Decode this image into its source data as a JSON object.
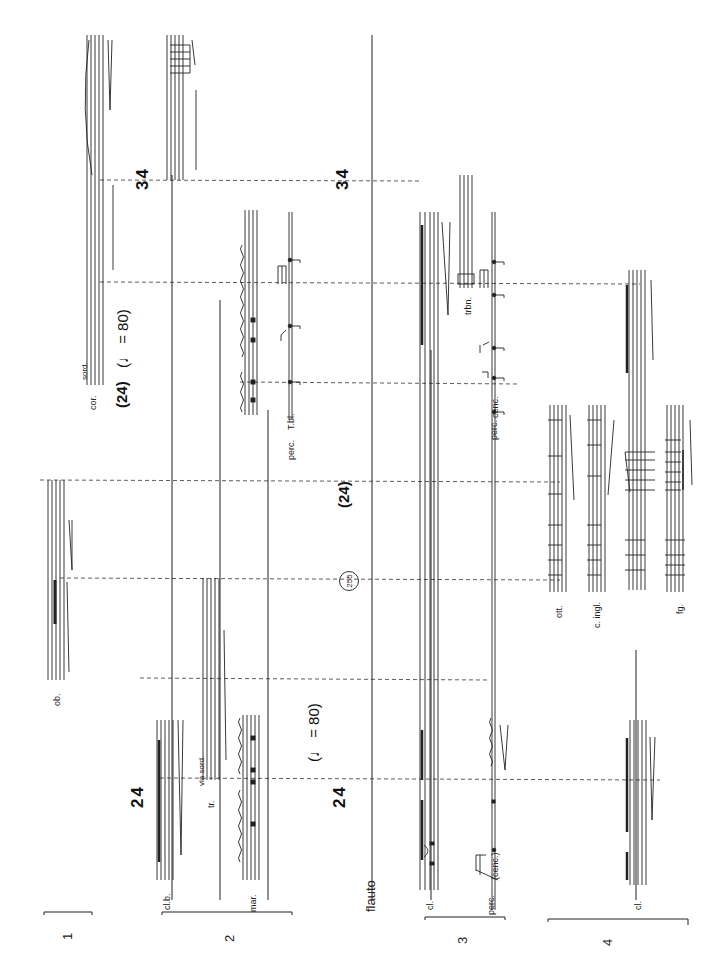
{
  "page": {
    "orientation": "rotated-90-ccw",
    "rehearsal_mark": "255"
  },
  "groups": [
    {
      "number": "1",
      "instruments": []
    },
    {
      "number": "2",
      "instruments": [
        "cl.b.",
        "mar."
      ]
    },
    {
      "number": "3",
      "instruments": [
        "cl.",
        "perc."
      ]
    },
    {
      "number": "4",
      "instruments": [
        "cl."
      ]
    }
  ],
  "solo": {
    "label": "flauto"
  },
  "instruments": {
    "ob": "ob.",
    "tr": "tr.",
    "tr_mute": "via sord.",
    "cor": "cor.",
    "cor_mute": "sord.",
    "perc_tbl": "perc.",
    "tbl": "T.bl.",
    "cenc_paren": "(cenc.)",
    "perc3b": "perc.",
    "cenc": "cenc.",
    "trbn": "trbn.",
    "ott": "ott.",
    "c_ingl": "c. ingl.",
    "fg": "fg."
  },
  "time_signatures": [
    {
      "id": "ts1",
      "value": "2/4",
      "top": "2",
      "bottom": "4"
    },
    {
      "id": "ts2",
      "value": "2/4",
      "top": "2",
      "bottom": "4"
    },
    {
      "id": "ts3",
      "value": "(2/4)",
      "top": "2",
      "bottom": "4"
    },
    {
      "id": "ts4",
      "value": "(2/4)",
      "top": "2",
      "bottom": "4"
    },
    {
      "id": "ts5",
      "value": "3/4",
      "top": "3",
      "bottom": "4"
    },
    {
      "id": "ts6",
      "value": "3/4",
      "top": "3",
      "bottom": "4"
    }
  ],
  "tempi": [
    {
      "id": "tempo1",
      "text": "(♩ = 80)"
    },
    {
      "id": "tempo2",
      "text": "(♩ = 80)"
    }
  ],
  "dynamics": [
    "ppp",
    "pp",
    "p",
    "ff",
    "mf",
    "f",
    "sfz",
    "fp",
    "sub. pp"
  ],
  "tuplets": [
    "3",
    "5",
    "6"
  ]
}
